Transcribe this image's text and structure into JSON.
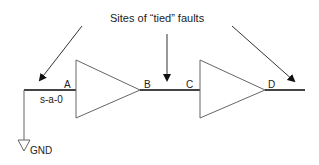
{
  "title": "Sites of “tied” faults",
  "nodes": {
    "a": "A",
    "b": "B",
    "c": "C",
    "d": "D"
  },
  "fault_label": "s-a-0",
  "ground_label": "GND",
  "colors": {
    "line": "#333333",
    "background": "#ffffff"
  }
}
